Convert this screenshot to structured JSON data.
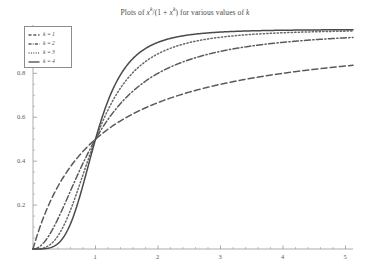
{
  "chart_data": {
    "type": "line",
    "title_parts": {
      "prefix": "Plots of ",
      "var": "x",
      "exp": "k",
      "mid": "/(1 + ",
      "var2": "x",
      "exp2": "k",
      "suffix": ") for various values of ",
      "kvar": "k"
    },
    "xlabel": "",
    "ylabel": "",
    "xlim": [
      0,
      5.12
    ],
    "ylim": [
      0,
      1.02
    ],
    "grid": false,
    "legend_position": "upper-left",
    "xticks": [
      1,
      2,
      3,
      4,
      5
    ],
    "xticklabels": [
      "1",
      "2",
      "3",
      "4",
      "5"
    ],
    "yticks": [
      0.2,
      0.4,
      0.6,
      0.8,
      1
    ],
    "yticklabels": [
      "0.2",
      "0.4",
      "0.6",
      "0.8",
      "1"
    ],
    "x": [
      0,
      0.1,
      0.2,
      0.3,
      0.4,
      0.5,
      0.6,
      0.7,
      0.8,
      0.9,
      1,
      1.2,
      1.4,
      1.6,
      1.8,
      2,
      2.25,
      2.5,
      2.75,
      3,
      3.25,
      3.5,
      3.75,
      4,
      4.25,
      4.5,
      4.75,
      5
    ],
    "series": [
      {
        "name": "k = 1",
        "k": 1,
        "style": "dashed",
        "color": "#5a5a5a",
        "values": [
          0,
          0.0909,
          0.1667,
          0.2308,
          0.2857,
          0.3333,
          0.375,
          0.4118,
          0.4444,
          0.4737,
          0.5,
          0.5455,
          0.5833,
          0.6154,
          0.6429,
          0.6667,
          0.6923,
          0.7143,
          0.7333,
          0.75,
          0.7647,
          0.7778,
          0.7895,
          0.8,
          0.8095,
          0.8182,
          0.8261,
          0.8333
        ]
      },
      {
        "name": "k = 2",
        "k": 2,
        "style": "dashdot",
        "color": "#5a5a5a",
        "values": [
          0,
          0.0099,
          0.0385,
          0.0826,
          0.1379,
          0.2,
          0.2647,
          0.3289,
          0.3902,
          0.4475,
          0.5,
          0.5902,
          0.6621,
          0.7191,
          0.7644,
          0.8,
          0.8351,
          0.8621,
          0.8832,
          0.9,
          0.9135,
          0.9245,
          0.9337,
          0.9412,
          0.9476,
          0.953,
          0.9576,
          0.9615
        ]
      },
      {
        "name": "k = 3",
        "k": 3,
        "style": "dotted",
        "color": "#6a6a6a",
        "values": [
          0,
          0.001,
          0.008,
          0.0263,
          0.0601,
          0.1111,
          0.1777,
          0.2553,
          0.3386,
          0.4216,
          0.5,
          0.6333,
          0.7329,
          0.8037,
          0.8536,
          0.8889,
          0.9192,
          0.9399,
          0.9545,
          0.9643,
          0.9716,
          0.9772,
          0.9815,
          0.9846,
          0.9872,
          0.9892,
          0.9907,
          0.9921
        ]
      },
      {
        "name": "k = 4",
        "k": 4,
        "style": "solid",
        "color": "#4a4a4a",
        "values": [
          0,
          0.0001,
          0.0016,
          0.0081,
          0.025,
          0.0588,
          0.1147,
          0.1937,
          0.2907,
          0.3963,
          0.5,
          0.6748,
          0.7932,
          0.8674,
          0.9131,
          0.9412,
          0.9628,
          0.975,
          0.983,
          0.9878,
          0.9911,
          0.9934,
          0.995,
          0.9961,
          0.997,
          0.9976,
          0.998,
          0.9984
        ]
      }
    ]
  }
}
